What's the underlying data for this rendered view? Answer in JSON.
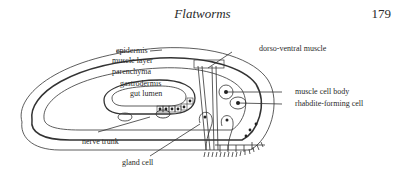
{
  "header": {
    "title": "Flatworms",
    "page_number": "179"
  },
  "diagram": {
    "labels": {
      "epidermis": "epidermis",
      "muscle_layer": "muscle layer",
      "parenchyma": "parenchyma",
      "gastrodermis": "gastrodermis",
      "gut_lumen": "gut lumen",
      "dorso_ventral_muscle": "dorso-ventral muscle",
      "muscle_cell_body": "muscle cell body",
      "rhabdite_forming_cell": "rhabdite-forming cell",
      "nerve_trunk": "nerve trunk",
      "gland_cell": "gland cell"
    }
  }
}
